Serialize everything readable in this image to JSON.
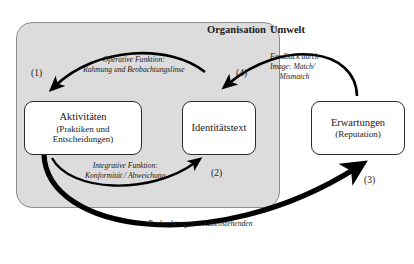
{
  "figure": {
    "regions": {
      "organisation_label": "Organisation",
      "umwelt_label": "Umwelt"
    },
    "nodes": [
      {
        "id": "aktivitaeten",
        "title": "Aktivitäten",
        "subtitle_line1": "(Praktiken und",
        "subtitle_line2": "Entscheidungen)"
      },
      {
        "id": "identitaetstext",
        "title": "Identitätstext",
        "subtitle_line1": "",
        "subtitle_line2": ""
      },
      {
        "id": "erwartungen",
        "title": "Erwartungen",
        "subtitle_line1": "(Reputation)",
        "subtitle_line2": ""
      }
    ],
    "annotations": {
      "operative_line1": "Operative Funktion:",
      "operative_line2": "Rahmung und Beobachtungslinse",
      "integrative_line1": "Integrative Funktion:",
      "integrative_line2": "Konformität / Abweichung",
      "feedback_line1": "Feedback durch",
      "feedback_line2": "Image: Match/",
      "feedback_line3": "Mismatch",
      "beobachtung": "Beobachtung von Außenstehenden"
    },
    "markers": {
      "one": "(1)",
      "two": "(2)",
      "three": "(3)",
      "four": "(4)"
    },
    "colors": {
      "organisation_fill": "#dcdcdc",
      "organisation_border": "#8c8c8c",
      "node_fill": "#ffffff",
      "node_border": "#2b2b2b",
      "arrow": "#000000",
      "page": "#ffffff"
    }
  }
}
